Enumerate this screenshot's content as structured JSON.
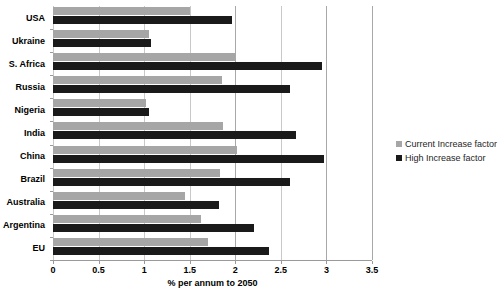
{
  "chart_data": {
    "type": "bar",
    "orientation": "horizontal",
    "title": "",
    "subtitle": "",
    "xlabel": "% per annum to 2050",
    "ylabel": "",
    "xlim": [
      0,
      3.5
    ],
    "xticks": [
      "0",
      "0.5",
      "1",
      "1.5",
      "2",
      "2.5",
      "3",
      "3.5"
    ],
    "xtick_values": [
      0,
      0.5,
      1,
      1.5,
      2,
      2.5,
      3,
      3.5
    ],
    "grid": "vertical",
    "legend_position": "right",
    "categories": [
      "USA",
      "Ukraine",
      "S. Africa",
      "Russia",
      "Nigeria",
      "India",
      "China",
      "Brazil",
      "Australia",
      "Argentina",
      "EU"
    ],
    "series": [
      {
        "name": "Current Increase factor",
        "color": "#a6a6a6",
        "values": [
          1.5,
          1.05,
          2.0,
          1.85,
          1.02,
          1.87,
          2.02,
          1.83,
          1.45,
          1.62,
          1.7
        ]
      },
      {
        "name": "High Increase factor",
        "color": "#1a1a1a",
        "values": [
          1.96,
          1.08,
          2.95,
          2.6,
          1.05,
          2.67,
          2.97,
          2.6,
          1.82,
          2.2,
          2.37
        ]
      }
    ]
  },
  "legend": {
    "items": [
      {
        "label": "Current Increase factor",
        "color": "#a6a6a6"
      },
      {
        "label": "High Increase factor",
        "color": "#1a1a1a"
      }
    ]
  },
  "axis": {
    "x_title": "% per annum to 2050"
  }
}
